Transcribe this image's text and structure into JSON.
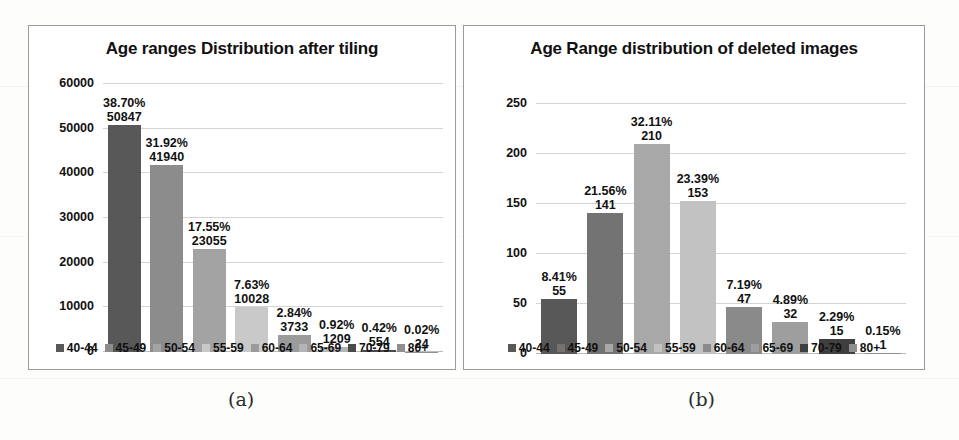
{
  "figure": {
    "caption_a": "(a)",
    "caption_b": "(b)"
  },
  "chart_data": [
    {
      "id": "a",
      "type": "bar",
      "title": "Age ranges Distribution after tiling",
      "xlabel": "",
      "ylabel": "",
      "categories": [
        "40-44",
        "45-49",
        "50-54",
        "55-59",
        "60-64",
        "65-69",
        "70-79",
        "80+"
      ],
      "values": [
        50847,
        41940,
        23055,
        10028,
        3733,
        1209,
        554,
        24
      ],
      "percent_labels": [
        "38.70%",
        "31.92%",
        "17.55%",
        "7.63%",
        "2.84%",
        "0.92%",
        "0.42%",
        "0.02%"
      ],
      "value_labels": [
        "50847",
        "41940",
        "23055",
        "10028",
        "3733",
        "1209",
        "554",
        "24"
      ],
      "ylim": [
        0,
        60000
      ],
      "yticks": [
        "0",
        "10000",
        "20000",
        "30000",
        "40000",
        "50000",
        "60000"
      ],
      "ytick_values": [
        0,
        10000,
        20000,
        30000,
        40000,
        50000,
        60000
      ],
      "grid": true,
      "legend_position": "bottom",
      "colors": [
        "#585858",
        "#8c8c8c",
        "#a3a3a3",
        "#c9c9c9",
        "#9b9b9b",
        "#b4b4b4",
        "#4a4a4a",
        "#8f8f8f"
      ]
    },
    {
      "id": "b",
      "type": "bar",
      "title": "Age Range distribution of deleted images",
      "xlabel": "",
      "ylabel": "",
      "categories": [
        "40-44",
        "45-49",
        "50-54",
        "55-59",
        "60-64",
        "65-69",
        "70-79",
        "80+"
      ],
      "values": [
        55,
        141,
        210,
        153,
        47,
        32,
        15,
        1
      ],
      "percent_labels": [
        "8.41%",
        "21.56%",
        "32.11%",
        "23.39%",
        "7.19%",
        "4.89%",
        "2.29%",
        "0.15%"
      ],
      "value_labels": [
        "55",
        "141",
        "210",
        "153",
        "47",
        "32",
        "15",
        "1"
      ],
      "ylim": [
        0,
        250
      ],
      "yticks": [
        "0",
        "50",
        "100",
        "150",
        "200",
        "250"
      ],
      "ytick_values": [
        0,
        50,
        100,
        150,
        200,
        250
      ],
      "grid": true,
      "legend_position": "bottom",
      "colors": [
        "#585858",
        "#737373",
        "#a8a8a8",
        "#c2c2c2",
        "#8a8a8a",
        "#9e9e9e",
        "#3f3f3f",
        "#8f8f8f"
      ]
    }
  ]
}
